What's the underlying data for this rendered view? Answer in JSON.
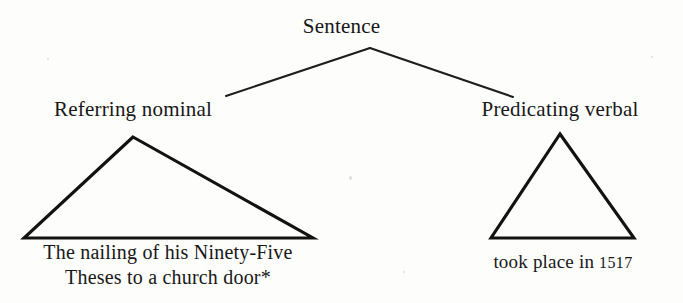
{
  "diagram": {
    "type": "syntax-tree",
    "title_node": "Sentence",
    "ink_color": "#171717",
    "background_color": "#fdfdfc",
    "root": {
      "label": "Sentence"
    },
    "branches": [
      {
        "label": "Referring nominal",
        "terminal_lines": [
          "The nailing of his Ninety-Five",
          "Theses to a church door*"
        ],
        "triangle": "left-triangle"
      },
      {
        "label": "Predicating verbal",
        "terminal_prefix": "took place in ",
        "terminal_year": "1517",
        "triangle": "right-triangle"
      }
    ]
  }
}
